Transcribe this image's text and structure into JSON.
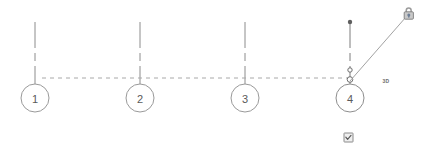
{
  "view": {
    "title": "Grid elevation view",
    "background_color": "#ffffff",
    "line_color": "#8c8c8c",
    "bubble_stroke_color": "#9a9a9a",
    "text_color": "#5a5a5a",
    "selected_color": "#6e6e6e"
  },
  "grids": [
    {
      "label": "1",
      "bubble_cx": 35,
      "bubble_cy": 98,
      "bubble_r": 14,
      "line_x": 35,
      "line_top_y": 22,
      "line_bottom_y": 84,
      "selected": false
    },
    {
      "label": "2",
      "bubble_cx": 140,
      "bubble_cy": 98,
      "bubble_r": 14,
      "line_x": 140,
      "line_top_y": 22,
      "line_bottom_y": 84,
      "selected": false
    },
    {
      "label": "3",
      "bubble_cx": 245,
      "bubble_cy": 98,
      "bubble_r": 14,
      "line_x": 245,
      "line_top_y": 22,
      "line_bottom_y": 84,
      "selected": false
    },
    {
      "label": "4",
      "bubble_cx": 350,
      "bubble_cy": 98,
      "bubble_r": 14,
      "line_x": 350,
      "line_top_y": 22,
      "line_bottom_y": 84,
      "selected": true
    }
  ],
  "datum_line": {
    "name": "level-datum-line",
    "x1": 42,
    "x2": 352,
    "y": 78
  },
  "selection_controls": {
    "endpoint_dot": {
      "cx": 350,
      "cy": 22,
      "r": 2
    },
    "drag_handle_upper": {
      "cx": 350,
      "cy": 70,
      "r": 2.2
    },
    "drag_handle_lower": {
      "cx": 350,
      "cy": 79,
      "r": 2.6
    },
    "leader_line": {
      "x1": 350,
      "y1": 81,
      "x2": 408,
      "y2": 16
    }
  },
  "padlock": {
    "label": "padlock-unlocked",
    "x": 403,
    "y": 5,
    "width": 11,
    "height": 13
  },
  "view_tag": {
    "label": "3D",
    "x": 386,
    "y": 81
  },
  "toggle_2d3d": {
    "label": "2d-3d-extents-checkbox",
    "checked": true,
    "x": 344,
    "y": 133,
    "size": 9
  }
}
